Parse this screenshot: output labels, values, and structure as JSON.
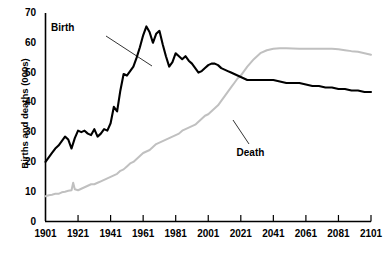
{
  "clipped_header_text": "Results are shown",
  "chart_data": {
    "type": "line",
    "title": "",
    "xlabel": "",
    "ylabel": "Births and deaths (000s)",
    "xlim": [
      1901,
      2101
    ],
    "ylim": [
      0,
      70
    ],
    "grid": false,
    "legend_position": "inline-annotations",
    "xticks": [
      1901,
      1921,
      1941,
      1961,
      1981,
      2001,
      2021,
      2041,
      2061,
      2081,
      2101
    ],
    "yticks": [
      0,
      10,
      20,
      30,
      40,
      50,
      60,
      70
    ],
    "annotations": [
      {
        "text": "Birth",
        "series": "Birth",
        "x": 1913,
        "y": 65
      },
      {
        "text": "Death",
        "series": "Death",
        "x": 2027,
        "y": 23
      }
    ],
    "series": [
      {
        "name": "Birth",
        "color": "#000000",
        "x": [
          1901,
          1903,
          1905,
          1907,
          1909,
          1911,
          1913,
          1915,
          1917,
          1919,
          1921,
          1923,
          1925,
          1927,
          1929,
          1931,
          1933,
          1935,
          1937,
          1939,
          1941,
          1943,
          1945,
          1947,
          1949,
          1951,
          1953,
          1955,
          1957,
          1959,
          1961,
          1963,
          1965,
          1967,
          1969,
          1971,
          1973,
          1975,
          1977,
          1979,
          1981,
          1983,
          1985,
          1987,
          1989,
          1991,
          1993,
          1995,
          1997,
          1999,
          2001,
          2003,
          2005,
          2007,
          2009,
          2011,
          2013,
          2015,
          2017,
          2019,
          2021,
          2025,
          2029,
          2033,
          2037,
          2041,
          2045,
          2049,
          2053,
          2057,
          2061,
          2065,
          2069,
          2073,
          2077,
          2081,
          2085,
          2089,
          2093,
          2097,
          2101
        ],
        "y": [
          20.0,
          21.5,
          23.0,
          24.5,
          25.5,
          27.0,
          28.5,
          27.5,
          24.5,
          28.0,
          30.5,
          30.0,
          30.5,
          29.5,
          29.0,
          31.0,
          28.5,
          29.5,
          31.0,
          30.5,
          33.0,
          38.5,
          37.0,
          44.0,
          49.5,
          49.0,
          50.5,
          52.0,
          55.0,
          58.5,
          62.5,
          65.5,
          63.5,
          60.0,
          63.0,
          64.0,
          59.5,
          55.5,
          52.0,
          53.5,
          56.5,
          55.5,
          54.5,
          55.5,
          54.0,
          53.0,
          51.5,
          50.0,
          50.5,
          51.5,
          52.5,
          53.0,
          53.0,
          52.5,
          51.5,
          51.0,
          50.5,
          50.0,
          49.5,
          49.0,
          48.5,
          47.5,
          47.5,
          47.5,
          47.5,
          47.5,
          47.0,
          46.5,
          46.5,
          46.5,
          46.0,
          45.5,
          45.5,
          45.0,
          45.0,
          44.5,
          44.5,
          44.0,
          44.0,
          43.5,
          43.5
        ]
      },
      {
        "name": "Death",
        "color": "#c0c0c0",
        "x": [
          1901,
          1903,
          1905,
          1907,
          1909,
          1911,
          1913,
          1915,
          1917,
          1918,
          1919,
          1921,
          1923,
          1925,
          1927,
          1929,
          1931,
          1933,
          1935,
          1937,
          1939,
          1941,
          1943,
          1945,
          1947,
          1949,
          1951,
          1953,
          1955,
          1957,
          1959,
          1961,
          1963,
          1965,
          1967,
          1969,
          1971,
          1973,
          1975,
          1977,
          1979,
          1981,
          1983,
          1985,
          1987,
          1989,
          1991,
          1993,
          1995,
          1997,
          1999,
          2001,
          2003,
          2005,
          2007,
          2009,
          2011,
          2013,
          2015,
          2017,
          2019,
          2021,
          2025,
          2029,
          2033,
          2037,
          2041,
          2045,
          2049,
          2053,
          2057,
          2061,
          2065,
          2069,
          2073,
          2077,
          2081,
          2085,
          2089,
          2093,
          2097,
          2101
        ],
        "y": [
          8.5,
          8.8,
          9.0,
          9.3,
          9.3,
          9.8,
          10.0,
          10.3,
          10.5,
          13.0,
          10.8,
          10.5,
          11.0,
          11.5,
          12.0,
          12.5,
          12.5,
          13.0,
          13.5,
          14.0,
          14.5,
          15.0,
          15.5,
          16.0,
          17.0,
          17.5,
          18.5,
          19.5,
          20.0,
          21.0,
          22.0,
          23.0,
          23.5,
          24.0,
          25.0,
          26.0,
          26.5,
          27.0,
          27.5,
          28.0,
          28.5,
          29.0,
          29.5,
          30.5,
          31.0,
          31.5,
          32.0,
          32.5,
          33.5,
          34.5,
          35.5,
          36.0,
          37.0,
          38.0,
          39.0,
          40.5,
          42.0,
          43.5,
          45.0,
          46.5,
          48.0,
          49.0,
          52.0,
          54.5,
          56.5,
          57.5,
          58.0,
          58.2,
          58.2,
          58.1,
          58.0,
          58.0,
          58.0,
          58.0,
          58.0,
          58.0,
          57.8,
          57.5,
          57.2,
          57.0,
          56.5,
          56.0
        ]
      }
    ]
  }
}
